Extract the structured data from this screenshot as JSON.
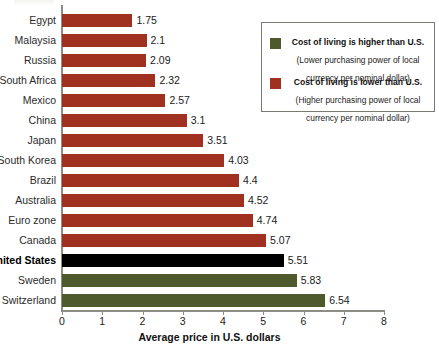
{
  "chart_data": {
    "type": "bar",
    "orientation": "horizontal",
    "title": "",
    "xlabel": "Average price in U.S. dollars",
    "ylabel": "",
    "xlim": [
      0,
      8
    ],
    "xticks": [
      0,
      1,
      2,
      3,
      4,
      5,
      6,
      7,
      8
    ],
    "xtick_labels": [
      "0",
      "1",
      "2",
      "3",
      "4",
      "5",
      "6",
      "7",
      "8"
    ],
    "grid": false,
    "categories": [
      "Egypt",
      "Malaysia",
      "Russia",
      "South Africa",
      "Mexico",
      "China",
      "Japan",
      "South Korea",
      "Brazil",
      "Australia",
      "Euro zone",
      "Canada",
      "United States",
      "Sweden",
      "Switzerland"
    ],
    "values": [
      1.75,
      2.1,
      2.09,
      2.32,
      2.57,
      3.1,
      3.51,
      4.03,
      4.4,
      4.52,
      4.74,
      5.07,
      5.51,
      5.83,
      6.54
    ],
    "value_labels": [
      "1.75",
      "2.1",
      "2.09",
      "2.32",
      "2.57",
      "3.1",
      "3.51",
      "4.03",
      "4.4",
      "4.52",
      "4.74",
      "5.07",
      "5.51",
      "5.83",
      "6.54"
    ],
    "bar_colors": [
      "red",
      "red",
      "red",
      "red",
      "red",
      "red",
      "red",
      "red",
      "red",
      "red",
      "red",
      "red",
      "black",
      "green",
      "green"
    ],
    "highlight_category": "United States",
    "colors": {
      "lower_cost": "#a0301f",
      "higher_cost": "#4e5a2c",
      "reference": "#000000",
      "axis": "#8d8d86"
    },
    "legend": {
      "position": "top-right",
      "entries": [
        {
          "swatch": "green",
          "heading": "Cost of living is higher than U.S.",
          "sub_line1": "(Lower purchasing power of local",
          "sub_line2": "currency per nominal dollar)"
        },
        {
          "swatch": "red",
          "heading": "Cost of living is lower than U.S.",
          "sub_line1": "(Higher purchasing power of local",
          "sub_line2": "currency per nominal dollar)"
        }
      ]
    }
  }
}
